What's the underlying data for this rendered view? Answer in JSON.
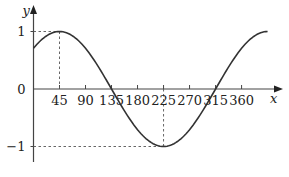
{
  "chart_data": {
    "type": "line",
    "title": "",
    "function": "y = sin(x + 45°)",
    "xlabel": "x",
    "ylabel": "y",
    "xticks": [
      45,
      90,
      135,
      180,
      225,
      270,
      315,
      360
    ],
    "xtick_labels": [
      "45",
      "90",
      "135",
      "180",
      "225",
      "270",
      "315",
      "360"
    ],
    "yticks": [
      1,
      0,
      -1
    ],
    "ytick_labels": [
      "1",
      "0",
      "−1"
    ],
    "xlim": [
      0,
      410
    ],
    "ylim": [
      -1.2,
      1.25
    ],
    "grid": false,
    "annotations": [
      {
        "type": "dashed-guide",
        "point": [
          45,
          1
        ]
      },
      {
        "type": "dashed-guide",
        "point": [
          225,
          -1
        ]
      }
    ],
    "series": [
      {
        "name": "curve",
        "x": [
          0,
          45,
          90,
          135,
          180,
          225,
          270,
          315,
          360,
          405
        ],
        "values": [
          0.707,
          1,
          0.707,
          0,
          -0.707,
          -1,
          -0.707,
          0,
          0.707,
          1
        ]
      }
    ]
  }
}
